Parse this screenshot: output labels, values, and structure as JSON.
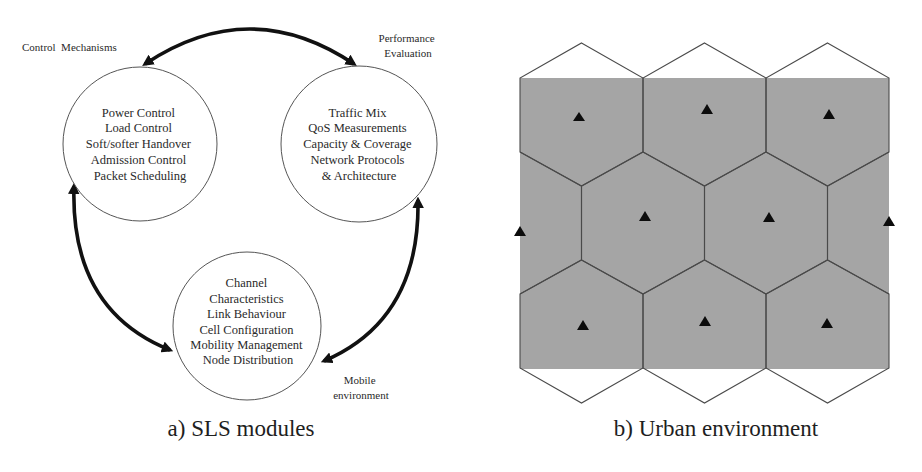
{
  "panel_a": {
    "caption": "a) SLS modules",
    "labels": {
      "control": "Control  Mechanisms",
      "performance_line1": "Performance",
      "performance_line2": "Evaluation",
      "mobile_line1": "Mobile",
      "mobile_line2": "environment"
    },
    "modules": [
      {
        "name": "control-mechanisms",
        "lines": [
          "Power Control",
          "Load Control",
          "Soft/softer Handover",
          "Admission Control",
          "Packet Scheduling"
        ]
      },
      {
        "name": "performance-evaluation",
        "lines": [
          "Traffic Mix",
          "QoS Measurements",
          "Capacity & Coverage",
          "Network Protocols",
          "& Architecture"
        ]
      },
      {
        "name": "mobile-environment",
        "lines": [
          "Channel",
          "Characteristics",
          "Link Behaviour",
          "Cell Configuration",
          "Mobility Management",
          "Node Distribution"
        ]
      }
    ],
    "arrows": [
      {
        "from": "control-mechanisms",
        "to": "performance-evaluation",
        "bidirectional": true
      },
      {
        "from": "control-mechanisms",
        "to": "mobile-environment",
        "bidirectional": true
      },
      {
        "from": "mobile-environment",
        "to": "performance-evaluation",
        "bidirectional": true
      }
    ]
  },
  "panel_b": {
    "caption": "b) Urban environment",
    "grid": {
      "rows": 3,
      "hex_cells_full": 8,
      "base_stations": 11
    },
    "colors": {
      "area_fill": "#a5a5a5",
      "hex_edge": "#4a4a4a",
      "base_station": "#0c0c0c"
    }
  }
}
